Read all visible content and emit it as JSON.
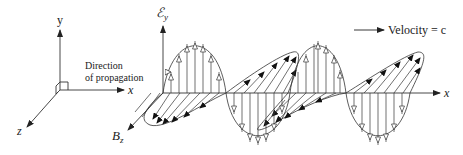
{
  "figure": {
    "colors": {
      "line": "#333333",
      "background": "#ffffff"
    }
  },
  "axes_legend": {
    "y_label": "y",
    "x_label": "x",
    "z_label": "z",
    "direction_line1": "Direction",
    "direction_line2": "of propagation"
  },
  "wave": {
    "e_field_label_main": "ℰ",
    "e_field_label_sub": "y",
    "b_field_label_main": "B",
    "b_field_label_sub": "z",
    "x_axis_label": "x",
    "velocity_label": "Velocity = c"
  }
}
